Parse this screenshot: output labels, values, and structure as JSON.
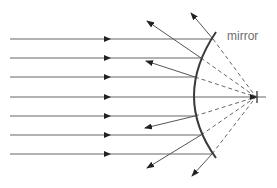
{
  "diagram": {
    "type": "convex-mirror-ray-diagram",
    "labels": {
      "mirror": "mirror"
    },
    "colors": {
      "ray": "#555555",
      "mirror": "#3a3a3a",
      "dashed": "#666666",
      "label": "#6e6e6e"
    },
    "incident_rays_count": 7,
    "focal_point": {
      "x": 256,
      "y": 97
    }
  }
}
